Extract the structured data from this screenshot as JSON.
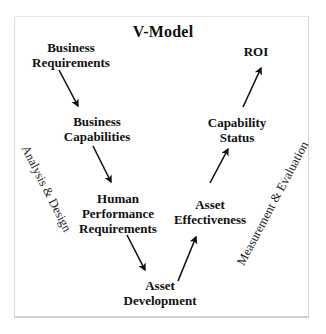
{
  "diagram": {
    "title": "V-Model",
    "nodes": [
      {
        "id": "business-requirements",
        "lines": [
          "Business",
          "Requirements"
        ]
      },
      {
        "id": "business-capabilities",
        "lines": [
          "Business",
          "Capabilities"
        ]
      },
      {
        "id": "human-performance-requirements",
        "lines": [
          "Human",
          "Performance",
          "Requirements"
        ]
      },
      {
        "id": "asset-development",
        "lines": [
          "Asset",
          "Development"
        ]
      },
      {
        "id": "asset-effectiveness",
        "lines": [
          "Asset",
          "Effectiveness"
        ]
      },
      {
        "id": "capability-status",
        "lines": [
          "Capability",
          "Status"
        ]
      },
      {
        "id": "roi",
        "lines": [
          "ROI"
        ]
      }
    ],
    "phases": {
      "left": "Analysis & Design",
      "right": "Measurement & Evaluation"
    },
    "edges": [
      {
        "from": "business-requirements",
        "to": "business-capabilities"
      },
      {
        "from": "business-capabilities",
        "to": "human-performance-requirements"
      },
      {
        "from": "human-performance-requirements",
        "to": "asset-development"
      },
      {
        "from": "asset-development",
        "to": "asset-effectiveness"
      },
      {
        "from": "asset-effectiveness",
        "to": "capability-status"
      },
      {
        "from": "capability-status",
        "to": "roi"
      }
    ],
    "colors": {
      "text": "#111111",
      "arrow": "#111111",
      "frame": "#d4d4d4",
      "background": "#ffffff"
    }
  }
}
